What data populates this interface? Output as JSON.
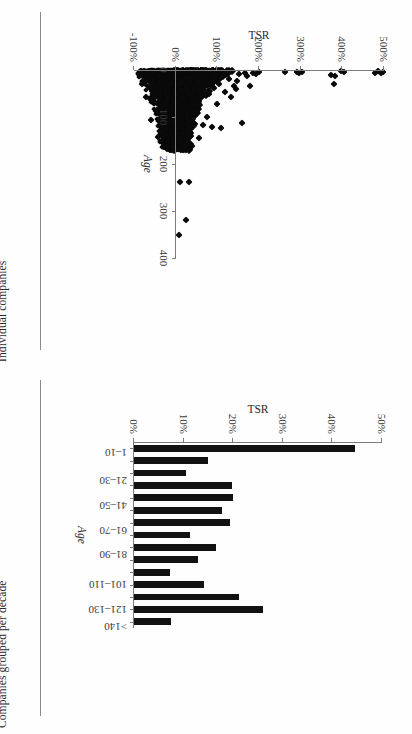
{
  "figure": {
    "background": "#fefefe",
    "ink": "#121212",
    "axis_color": "#7c7c7c"
  },
  "panels": [
    {
      "caption": "Individual companies"
    },
    {
      "caption": "Companies grouped per decade"
    }
  ],
  "chart_data": [
    {
      "type": "scatter",
      "title": "",
      "xlabel": "TSR",
      "ylabel": "Age",
      "orientation": "rotated-90-clockwise",
      "grid": false,
      "legend": "none",
      "marker": "diamond",
      "marker_color": "#0a0a0a",
      "xlim": [
        -100,
        500
      ],
      "xtick_labels": [
        "500%",
        "400%",
        "300%",
        "200%",
        "100%",
        "0%",
        "-100%"
      ],
      "xticks": [
        500,
        400,
        300,
        200,
        100,
        0,
        -100
      ],
      "ylim": [
        0,
        400
      ],
      "ytick_labels": [
        "0",
        "100",
        "200",
        "300",
        "400"
      ],
      "yticks": [
        0,
        100,
        200,
        300,
        400
      ],
      "note": "x = TSR (%), y = Age (years); several thousand companies, dense cluster near 0% TSR",
      "points": [
        [
          498,
          4
        ],
        [
          492,
          6
        ],
        [
          486,
          3
        ],
        [
          479,
          7
        ],
        [
          404,
          4
        ],
        [
          396,
          3
        ],
        [
          382,
          12
        ],
        [
          379,
          30
        ],
        [
          372,
          10
        ],
        [
          303,
          5
        ],
        [
          297,
          7
        ],
        [
          291,
          4
        ],
        [
          262,
          5
        ],
        [
          201,
          4
        ],
        [
          192,
          9
        ],
        [
          186,
          6
        ],
        [
          179,
          33
        ],
        [
          172,
          12
        ],
        [
          166,
          7
        ],
        [
          159,
          112
        ],
        [
          152,
          8
        ],
        [
          148,
          24
        ],
        [
          144,
          41
        ],
        [
          139,
          33
        ],
        [
          134,
          57
        ],
        [
          129,
          18
        ],
        [
          124,
          9
        ],
        [
          119,
          46
        ],
        [
          114,
          6
        ],
        [
          109,
          124
        ],
        [
          104,
          29
        ],
        [
          99,
          72
        ],
        [
          96,
          14
        ],
        [
          93,
          38
        ],
        [
          90,
          6
        ],
        [
          87,
          121
        ],
        [
          84,
          18
        ],
        [
          81,
          52
        ],
        [
          78,
          9
        ],
        [
          75,
          99
        ],
        [
          72,
          26
        ],
        [
          69,
          4
        ],
        [
          66,
          116
        ],
        [
          63,
          31
        ],
        [
          60,
          8
        ],
        [
          57,
          145
        ],
        [
          54,
          22
        ],
        [
          51,
          63
        ],
        [
          48,
          11
        ],
        [
          45,
          86
        ],
        [
          42,
          35
        ],
        [
          39,
          162
        ],
        [
          36,
          14
        ],
        [
          33,
          238
        ],
        [
          31,
          7
        ],
        [
          29,
          104
        ],
        [
          27,
          48
        ],
        [
          25,
          320
        ],
        [
          23,
          19
        ],
        [
          21,
          132
        ],
        [
          19,
          61
        ],
        [
          17,
          9
        ],
        [
          15,
          166
        ],
        [
          13,
          27
        ],
        [
          11,
          238
        ],
        [
          10,
          85
        ],
        [
          9,
          350
        ],
        [
          8,
          41
        ],
        [
          7,
          143
        ],
        [
          6,
          16
        ],
        [
          5,
          97
        ],
        [
          4,
          58
        ],
        [
          3,
          23
        ],
        [
          2,
          168
        ],
        [
          1,
          6
        ],
        [
          0,
          121
        ],
        [
          -2,
          36
        ],
        [
          -4,
          79
        ],
        [
          -6,
          12
        ],
        [
          -8,
          145
        ],
        [
          -10,
          54
        ],
        [
          -12,
          28
        ],
        [
          -14,
          108
        ],
        [
          -16,
          66
        ],
        [
          -18,
          8
        ],
        [
          -20,
          131
        ],
        [
          -22,
          44
        ],
        [
          -24,
          91
        ],
        [
          -26,
          17
        ],
        [
          -28,
          58
        ],
        [
          -30,
          105
        ],
        [
          -33,
          33
        ],
        [
          -36,
          76
        ],
        [
          -39,
          11
        ],
        [
          -42,
          142
        ],
        [
          -45,
          49
        ],
        [
          -48,
          88
        ],
        [
          -52,
          24
        ],
        [
          -56,
          63
        ],
        [
          -60,
          106
        ],
        [
          -64,
          37
        ],
        [
          -68,
          15
        ],
        [
          -72,
          57
        ],
        [
          -76,
          6
        ],
        [
          -80,
          29
        ],
        [
          -84,
          9
        ]
      ]
    },
    {
      "type": "bar",
      "title": "",
      "xlabel": "Age",
      "ylabel": "TSR",
      "orientation": "rotated-90-clockwise",
      "grid": false,
      "legend": "none",
      "bar_color": "#121212",
      "categories": [
        "1–10",
        "11–20",
        "21–30",
        "31–40",
        "41–50",
        "51–60",
        "61–70",
        "71–80",
        "81–90",
        "91–100",
        "101–110",
        "111–120",
        "121–130",
        "131–140",
        ">140"
      ],
      "tick_categories": [
        "1–10",
        "21–30",
        "41–50",
        "61–70",
        "81–90",
        "101–110",
        "121–130",
        ">140"
      ],
      "values": [
        44.5,
        15.0,
        10.5,
        19.8,
        20.0,
        17.8,
        19.3,
        11.2,
        16.5,
        13.0,
        7.3,
        14.2,
        21.2,
        26.0,
        7.5
      ],
      "value_labels": [
        "44.5%",
        "15.0%",
        "10.5%",
        "19.8%",
        "20.0%",
        "17.8%",
        "19.3%",
        "11.2%",
        "16.5%",
        "13.0%",
        "7.3%",
        "14.2%",
        "21.2%",
        "26.0%",
        "7.5%"
      ],
      "ylim": [
        0,
        50
      ],
      "ytick_labels": [
        "0%",
        "10%",
        "20%",
        "30%",
        "40%",
        "50%"
      ],
      "yticks": [
        0,
        10,
        20,
        30,
        40,
        50
      ]
    }
  ]
}
